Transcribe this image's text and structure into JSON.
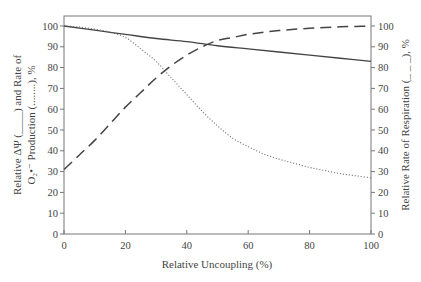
{
  "chart_data": {
    "type": "line",
    "title": "",
    "xlabel": "Relative Uncoupling (%)",
    "ylabel_left_line1": "Relative ΔΨ (____) and Rate of",
    "ylabel_left_line2": "O₂•⁻ Production (........), %",
    "ylabel_right": "Relative Rate of Respiration (_ _ _), %",
    "xlim": [
      0,
      100
    ],
    "ylim_left": [
      0,
      100
    ],
    "ylim_right": [
      0,
      100
    ],
    "x_ticks": [
      0,
      20,
      40,
      60,
      80,
      100
    ],
    "y_ticks": [
      0,
      10,
      20,
      30,
      40,
      50,
      60,
      70,
      80,
      90,
      100
    ],
    "grid": false,
    "legend": "none (line styles described in axis titles)",
    "series": [
      {
        "name": "Relative ΔΨ",
        "style": "solid",
        "axis": "left",
        "x": [
          0,
          10,
          20,
          30,
          40,
          50,
          60,
          70,
          80,
          90,
          100
        ],
        "y": [
          100,
          98,
          96,
          94,
          92.5,
          90.5,
          89,
          87.5,
          86,
          84.5,
          83
        ]
      },
      {
        "name": "Rate of O2 superoxide production",
        "style": "dotted",
        "axis": "left",
        "x": [
          0,
          5,
          10,
          15,
          20,
          25,
          30,
          35,
          40,
          45,
          50,
          55,
          60,
          65,
          70,
          75,
          80,
          85,
          90,
          95,
          100
        ],
        "y": [
          100,
          99.5,
          98.5,
          97,
          94.5,
          89,
          83,
          75,
          67,
          59,
          52,
          46,
          42,
          38.5,
          36,
          34,
          32,
          30.5,
          29,
          28,
          27
        ]
      },
      {
        "name": "Relative Rate of Respiration",
        "style": "dashed",
        "axis": "right",
        "x": [
          0,
          5,
          10,
          15,
          20,
          25,
          30,
          35,
          40,
          45,
          50,
          55,
          60,
          65,
          70,
          75,
          80,
          85,
          90,
          95,
          100
        ],
        "y": [
          31,
          38,
          45,
          53,
          61,
          68,
          75,
          81,
          86,
          90,
          93,
          94.5,
          96,
          97,
          97.8,
          98.4,
          98.9,
          99.3,
          99.6,
          99.8,
          100
        ]
      }
    ]
  }
}
